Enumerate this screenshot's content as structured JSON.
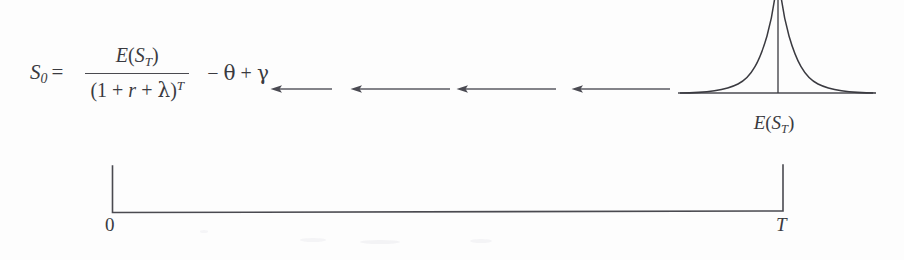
{
  "diagram": {
    "stroke_color": "#3a3a40",
    "background_color": "#fdfdfd"
  },
  "formula": {
    "lhs_symbol": "S",
    "lhs_subscript": "0",
    "equals": "=",
    "numerator_fn": "E",
    "numerator_open": "(",
    "numerator_var": "S",
    "numerator_var_sub": "T",
    "numerator_close": ")",
    "denominator_open": "(1 + ",
    "denominator_rate": "r",
    "denominator_plus": " + ",
    "denominator_lambda": "λ",
    "denominator_close": ")",
    "denominator_exponent": "T",
    "tail_minus": "− ",
    "tail_theta": "θ",
    "tail_plus": " + ",
    "tail_gamma": "γ",
    "full_text": "S0 = E(ST) / (1 + r + λ)^T − θ + γ"
  },
  "arrows": {
    "direction": "leftward",
    "count": 4,
    "meaning": "discounting back from T to 0",
    "items": [
      {
        "x": 270,
        "y": 89,
        "length": 62
      },
      {
        "x": 350,
        "y": 89,
        "length": 100
      },
      {
        "x": 456,
        "y": 89,
        "length": 100
      },
      {
        "x": 571,
        "y": 89,
        "length": 99
      }
    ]
  },
  "distribution": {
    "shape": "bell-curve",
    "label_fn": "E",
    "label_open": "(",
    "label_var": "S",
    "label_var_sub": "T",
    "label_close": ")",
    "label_text": "E(ST)",
    "has_mean_line": true,
    "baseline_start": 678,
    "baseline_end": 873,
    "center_x": 775
  },
  "timeline": {
    "start_label": "0",
    "end_label": "T",
    "start_x": 112,
    "end_x": 783,
    "bracket_top_y": 166,
    "bracket_bottom_y": 213
  }
}
